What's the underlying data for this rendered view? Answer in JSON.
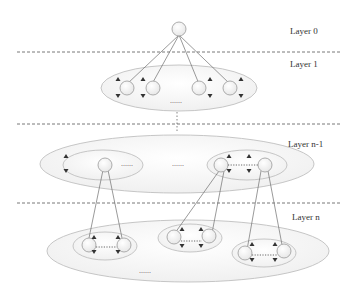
{
  "layers": [
    {
      "id": "layer-0",
      "label": "Layer 0"
    },
    {
      "id": "layer-1",
      "label": "Layer 1"
    },
    {
      "id": "layer-n-1",
      "label": "Layer n-1"
    },
    {
      "id": "layer-n",
      "label": "Layer n"
    }
  ],
  "ellipsis": "......",
  "colors": {
    "node_fill": "#f2f2f2",
    "node_stroke": "#999999",
    "ellipse_stroke": "#bfbfbf",
    "ellipse_fill": "#f7f7f7",
    "edge": "#6e6e6e",
    "divider": "#555555",
    "arrow": "#333333"
  }
}
